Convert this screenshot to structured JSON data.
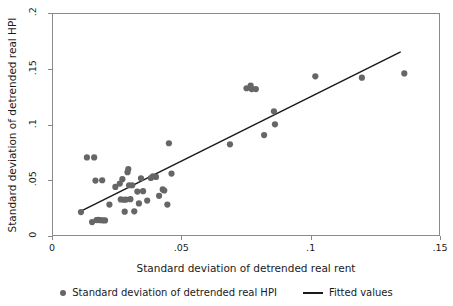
{
  "chart_data": {
    "type": "scatter",
    "title": "",
    "xlabel": "Standard deviation of detrended real rent",
    "ylabel": "Standard deviation of detrended real HPI",
    "xlim": [
      0,
      0.15
    ],
    "ylim": [
      0,
      0.2
    ],
    "xticks": [
      "0",
      ".05",
      ".1",
      ".15"
    ],
    "xtick_values": [
      0,
      0.05,
      0.1,
      0.15
    ],
    "yticks": [
      "0",
      ".05",
      ".1",
      ".15",
      ".2"
    ],
    "ytick_values": [
      0,
      0.05,
      0.1,
      0.15,
      0.2
    ],
    "grid": false,
    "legend_position": "bottom",
    "marker_color": "#666666",
    "line_color": "#1a1a1a",
    "frame_color": "#8a8a8a",
    "series": [
      {
        "name": "Standard deviation of detrended real HPI",
        "type": "scatter",
        "marker": "circle",
        "color": "#666666",
        "points": [
          [
            0.0112,
            0.0215
          ],
          [
            0.0135,
            0.0705
          ],
          [
            0.0155,
            0.0125
          ],
          [
            0.0163,
            0.0705
          ],
          [
            0.0168,
            0.0497
          ],
          [
            0.0172,
            0.0143
          ],
          [
            0.0178,
            0.0145
          ],
          [
            0.0186,
            0.0142
          ],
          [
            0.0194,
            0.05
          ],
          [
            0.0196,
            0.0141
          ],
          [
            0.0205,
            0.014
          ],
          [
            0.0222,
            0.0282
          ],
          [
            0.0245,
            0.044
          ],
          [
            0.0262,
            0.047
          ],
          [
            0.0266,
            0.0328
          ],
          [
            0.0272,
            0.051
          ],
          [
            0.0278,
            0.0325
          ],
          [
            0.0281,
            0.0218
          ],
          [
            0.0286,
            0.0327
          ],
          [
            0.0292,
            0.0572
          ],
          [
            0.0295,
            0.06
          ],
          [
            0.0298,
            0.0455
          ],
          [
            0.0303,
            0.033
          ],
          [
            0.031,
            0.0455
          ],
          [
            0.0318,
            0.0221
          ],
          [
            0.033,
            0.0398
          ],
          [
            0.0336,
            0.0292
          ],
          [
            0.0344,
            0.0518
          ],
          [
            0.0352,
            0.0402
          ],
          [
            0.0368,
            0.0318
          ],
          [
            0.0382,
            0.052
          ],
          [
            0.039,
            0.0535
          ],
          [
            0.0402,
            0.053
          ],
          [
            0.0414,
            0.036
          ],
          [
            0.0428,
            0.0418
          ],
          [
            0.0434,
            0.0408
          ],
          [
            0.0446,
            0.0282
          ],
          [
            0.0452,
            0.0832
          ],
          [
            0.0462,
            0.056
          ],
          [
            0.0688,
            0.0822
          ],
          [
            0.0752,
            0.1325
          ],
          [
            0.0768,
            0.1348
          ],
          [
            0.0772,
            0.1318
          ],
          [
            0.0788,
            0.1318
          ],
          [
            0.082,
            0.0905
          ],
          [
            0.0858,
            0.1118
          ],
          [
            0.0862,
            0.1002
          ],
          [
            0.1018,
            0.1432
          ],
          [
            0.1198,
            0.142
          ],
          [
            0.1362,
            0.1458
          ]
        ]
      },
      {
        "name": "Fitted values",
        "type": "line",
        "color": "#1a1a1a",
        "x": [
          0.0108,
          0.1348
        ],
        "y": [
          0.0218,
          0.1652
        ]
      }
    ],
    "legend": [
      {
        "label": "Standard deviation of detrended real HPI",
        "marker": "dot",
        "color": "#666666"
      },
      {
        "label": "Fitted values",
        "marker": "line",
        "color": "#1a1a1a"
      }
    ]
  }
}
